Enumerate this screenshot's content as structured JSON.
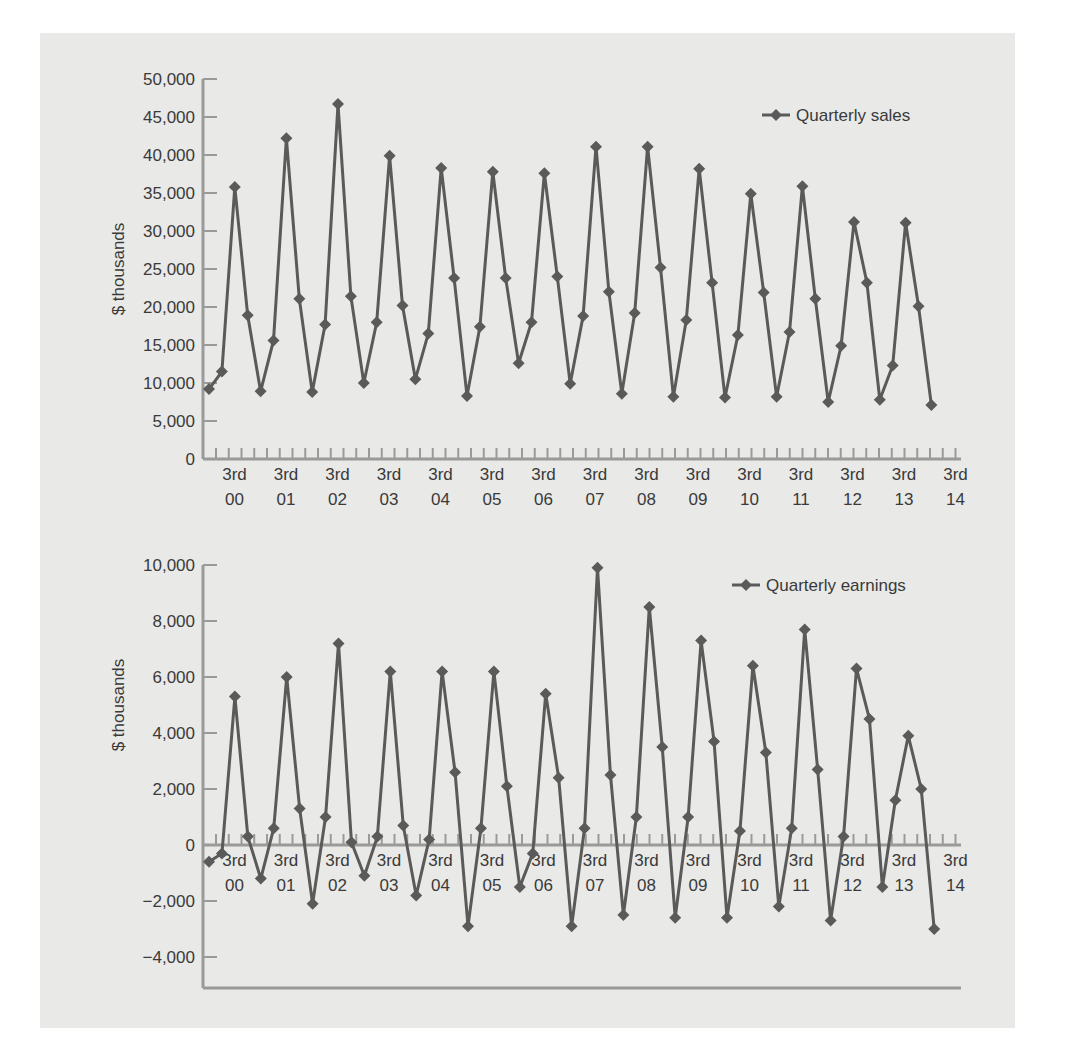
{
  "chart_data": [
    {
      "type": "line",
      "title": "",
      "legend": "Quarterly sales",
      "legend_position": "top-right",
      "xlabel": "",
      "ylabel": "$ thousands",
      "ylim": [
        0,
        50000
      ],
      "yticks": [
        0,
        5000,
        10000,
        15000,
        20000,
        25000,
        30000,
        35000,
        40000,
        45000,
        50000
      ],
      "ytick_labels": [
        "0",
        "5,000",
        "10,000",
        "15,000",
        "20,000",
        "25,000",
        "30,000",
        "35,000",
        "40,000",
        "45,000",
        "50,000"
      ],
      "xtick_labels": [
        [
          "3rd",
          "00"
        ],
        [
          "3rd",
          "01"
        ],
        [
          "3rd",
          "02"
        ],
        [
          "3rd",
          "03"
        ],
        [
          "3rd",
          "04"
        ],
        [
          "3rd",
          "05"
        ],
        [
          "3rd",
          "06"
        ],
        [
          "3rd",
          "07"
        ],
        [
          "3rd",
          "08"
        ],
        [
          "3rd",
          "09"
        ],
        [
          "3rd",
          "10"
        ],
        [
          "3rd",
          "11"
        ],
        [
          "3rd",
          "12"
        ],
        [
          "3rd",
          "13"
        ],
        [
          "3rd",
          "14"
        ]
      ],
      "grid": false,
      "marker": "diamond",
      "series": [
        {
          "name": "Quarterly sales",
          "values": [
            9200,
            11500,
            35800,
            18900,
            8900,
            15600,
            42200,
            21100,
            8800,
            17700,
            46700,
            21400,
            10000,
            18000,
            39900,
            20200,
            10500,
            16500,
            38300,
            23800,
            8300,
            17400,
            37800,
            23800,
            12600,
            18000,
            37600,
            24000,
            9900,
            18800,
            41100,
            22000,
            8600,
            19200,
            41100,
            25200,
            8200,
            18300,
            38200,
            23200,
            8100,
            16300,
            34900,
            21900,
            8200,
            16700,
            35900,
            21100,
            7500,
            14900,
            31200,
            23200,
            7800,
            12300,
            31100,
            20100,
            7100
          ]
        }
      ]
    },
    {
      "type": "line",
      "title": "",
      "legend": "Quarterly earnings",
      "legend_position": "top-right",
      "xlabel": "",
      "ylabel": "$ thousands",
      "ylim": [
        -5000,
        10000
      ],
      "yticks": [
        -4000,
        -2000,
        0,
        2000,
        4000,
        6000,
        8000,
        10000
      ],
      "ytick_labels": [
        "−4,000",
        "−2,000",
        "0",
        "2,000",
        "4,000",
        "6,000",
        "8,000",
        "10,000"
      ],
      "xtick_labels": [
        [
          "3rd",
          "00"
        ],
        [
          "3rd",
          "01"
        ],
        [
          "3rd",
          "02"
        ],
        [
          "3rd",
          "03"
        ],
        [
          "3rd",
          "04"
        ],
        [
          "3rd",
          "05"
        ],
        [
          "3rd",
          "06"
        ],
        [
          "3rd",
          "07"
        ],
        [
          "3rd",
          "08"
        ],
        [
          "3rd",
          "09"
        ],
        [
          "3rd",
          "10"
        ],
        [
          "3rd",
          "11"
        ],
        [
          "3rd",
          "12"
        ],
        [
          "3rd",
          "13"
        ],
        [
          "3rd",
          "14"
        ]
      ],
      "grid": false,
      "marker": "diamond",
      "series": [
        {
          "name": "Quarterly earnings",
          "values": [
            -600,
            -300,
            5300,
            300,
            -1200,
            600,
            6000,
            1300,
            -2100,
            1000,
            7200,
            100,
            -1100,
            300,
            6200,
            700,
            -1800,
            200,
            6200,
            2600,
            -2900,
            600,
            6200,
            2100,
            -1500,
            -300,
            5400,
            2400,
            -2900,
            600,
            9900,
            2500,
            -2500,
            1000,
            8500,
            3500,
            -2600,
            1000,
            7300,
            3700,
            -2600,
            500,
            6400,
            3300,
            -2200,
            600,
            7700,
            2700,
            -2700,
            300,
            6300,
            4500,
            -1500,
            1600,
            3900,
            2000,
            -3000
          ]
        }
      ]
    }
  ],
  "colors": {
    "panel_background": "#e9e9e7",
    "series_line": "#5a5a5a",
    "axis": "#9a9a98",
    "text": "#3a3a3a"
  }
}
